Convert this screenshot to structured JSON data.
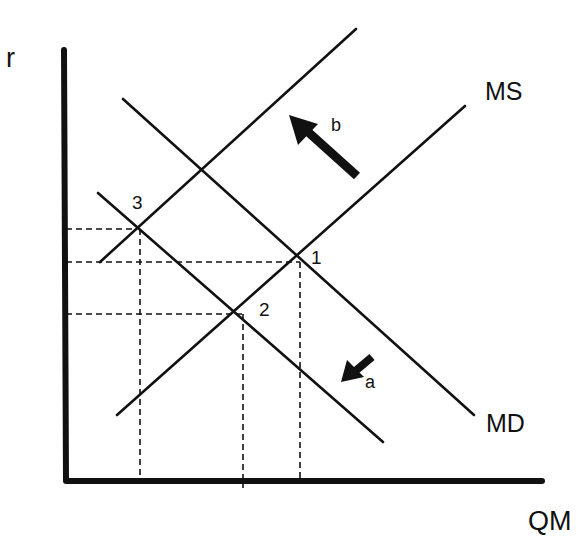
{
  "diagram": {
    "axes": {
      "y_label": "r",
      "x_label": "QM"
    },
    "curves": {
      "ms_label": "MS",
      "md_label": "MD"
    },
    "points": [
      {
        "id": "1",
        "label": "1"
      },
      {
        "id": "2",
        "label": "2"
      },
      {
        "id": "3",
        "label": "3"
      }
    ],
    "arrows": [
      {
        "id": "a",
        "label": "a",
        "direction": "down-left",
        "shifts": "MD"
      },
      {
        "id": "b",
        "label": "b",
        "direction": "up-left",
        "shifts": "MS"
      }
    ],
    "colors": {
      "ink": "#111111",
      "background": "#ffffff"
    }
  }
}
